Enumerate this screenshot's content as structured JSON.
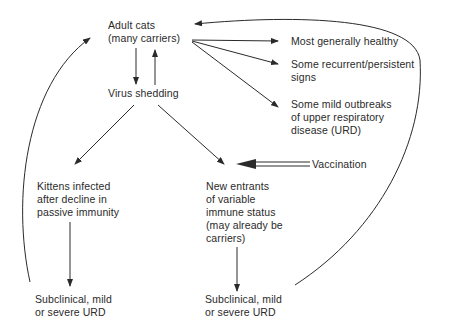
{
  "nodes": {
    "adult_cats": {
      "lines": [
        "Adult cats",
        "(many carriers)"
      ]
    },
    "virus_shedding": {
      "lines": [
        "Virus shedding"
      ]
    },
    "most_healthy": {
      "lines": [
        "Most generally healthy"
      ]
    },
    "recurrent_signs": {
      "lines": [
        "Some recurrent/persistent",
        "signs"
      ]
    },
    "mild_outbreaks": {
      "lines": [
        "Some mild outbreaks",
        "of upper respiratory",
        "disease (URD)"
      ]
    },
    "kittens": {
      "lines": [
        "Kittens infected",
        "after decline in",
        "passive immunity"
      ]
    },
    "new_entrants": {
      "lines": [
        "New entrants",
        "of variable",
        "immune status",
        "(may already be",
        "carriers)"
      ]
    },
    "vaccination": {
      "lines": [
        "Vaccination"
      ]
    },
    "kittens_outcome": {
      "lines": [
        "Subclinical, mild",
        "or severe URD"
      ]
    },
    "entrants_outcome": {
      "lines": [
        "Subclinical, mild",
        "or severe URD"
      ]
    }
  },
  "edges": [
    {
      "from": "adult_cats",
      "to": "virus_shedding"
    },
    {
      "from": "virus_shedding",
      "to": "adult_cats"
    },
    {
      "from": "adult_cats",
      "to": "most_healthy"
    },
    {
      "from": "adult_cats",
      "to": "recurrent_signs"
    },
    {
      "from": "adult_cats",
      "to": "mild_outbreaks"
    },
    {
      "from": "virus_shedding",
      "to": "kittens"
    },
    {
      "from": "virus_shedding",
      "to": "new_entrants"
    },
    {
      "from": "vaccination",
      "to": "new_entrants",
      "style": "double"
    },
    {
      "from": "kittens",
      "to": "kittens_outcome"
    },
    {
      "from": "new_entrants",
      "to": "entrants_outcome"
    },
    {
      "from": "kittens_outcome",
      "to": "adult_cats",
      "style": "curve"
    },
    {
      "from": "entrants_outcome",
      "to": "adult_cats",
      "style": "curve"
    }
  ],
  "colors": {
    "ink": "#2a2a2a",
    "background": "#ffffff"
  }
}
